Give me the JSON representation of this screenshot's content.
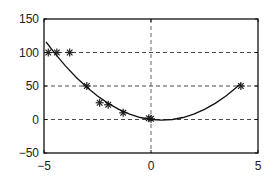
{
  "chart_data": {
    "type": "scatter",
    "title": "",
    "xlabel": "",
    "ylabel": "",
    "xlim": [
      -5,
      5
    ],
    "ylim": [
      -50,
      150
    ],
    "xticks": [
      -5,
      0,
      5
    ],
    "yticks": [
      -50,
      0,
      50,
      100,
      150
    ],
    "xtick_labels": [
      "−5",
      "0",
      "5"
    ],
    "ytick_labels": [
      "−50",
      "0",
      "50",
      "100",
      "150"
    ],
    "grid": {
      "style": "dashed",
      "x_at": [
        0
      ],
      "y_at": [
        0,
        50,
        100
      ]
    },
    "legend": null,
    "series": [
      {
        "name": "data",
        "type": "scatter",
        "marker": "asterisk",
        "color": "#222222",
        "x": [
          -4.8,
          -4.4,
          -3.8,
          -3.0,
          -2.4,
          -2.0,
          -1.3,
          -0.1,
          0.0,
          4.2
        ],
        "y": [
          100,
          100,
          100,
          50,
          25,
          22,
          10,
          2,
          1,
          50
        ]
      },
      {
        "name": "fit",
        "type": "line",
        "color": "#111111",
        "x": [
          -4.9,
          -4.5,
          -4.0,
          -3.5,
          -3.0,
          -2.5,
          -2.0,
          -1.5,
          -1.0,
          -0.5,
          0.0,
          0.5,
          1.0,
          1.5,
          2.0,
          2.5,
          3.0,
          3.5,
          4.0,
          4.2
        ],
        "y": [
          115.6,
          99.0,
          80.0,
          63.0,
          48.0,
          35.0,
          24.0,
          15.0,
          8.0,
          3.0,
          0.0,
          -1.0,
          0.0,
          3.0,
          8.0,
          15.0,
          24.0,
          35.0,
          48.0,
          53.8
        ]
      }
    ]
  }
}
